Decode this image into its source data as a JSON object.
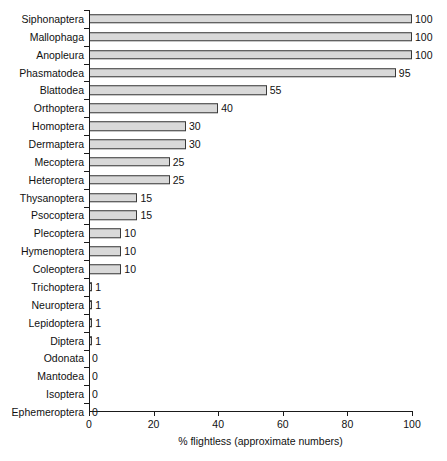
{
  "chart_data": {
    "type": "bar",
    "orientation": "horizontal",
    "title": "",
    "xlabel": "% flightless (approximate numbers)",
    "ylabel": "",
    "xlim": [
      0,
      100
    ],
    "xticks": [
      0,
      20,
      40,
      60,
      80,
      100
    ],
    "grid": false,
    "legend": null,
    "categories": [
      "Siphonaptera",
      "Mallophaga",
      "Anopleura",
      "Phasmatodea",
      "Blattodea",
      "Orthoptera",
      "Homoptera",
      "Dermaptera",
      "Mecoptera",
      "Heteroptera",
      "Thysanoptera",
      "Psocoptera",
      "Plecoptera",
      "Hymenoptera",
      "Coleoptera",
      "Trichoptera",
      "Neuroptera",
      "Lepidoptera",
      "Diptera",
      "Odonata",
      "Mantodea",
      "Isoptera",
      "Ephemeroptera"
    ],
    "values": [
      100,
      100,
      100,
      95,
      55,
      40,
      30,
      30,
      25,
      25,
      15,
      15,
      10,
      10,
      10,
      1,
      1,
      1,
      1,
      0,
      0,
      0,
      0
    ],
    "value_labels": [
      "100",
      "100",
      "100",
      "95",
      "55",
      "40",
      "30",
      "30",
      "25",
      "25",
      "15",
      "15",
      "10",
      "10",
      "10",
      "1",
      "1",
      "1",
      "1",
      "0",
      "0",
      "0",
      "0"
    ],
    "colors": {
      "bar_fill": "#d9d9d9",
      "bar_border": "#3a3a3a",
      "axis": "#1a1a1a",
      "text": "#111111",
      "background": "#ffffff"
    }
  }
}
